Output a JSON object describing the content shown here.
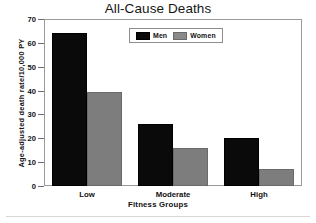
{
  "chart_data": {
    "type": "bar",
    "title": "All-Cause Deaths",
    "xlabel": "Fitness Groups",
    "ylabel": "Age-adjusted death rate/10,000 PY",
    "categories": [
      "Low",
      "Moderate",
      "High"
    ],
    "series": [
      {
        "name": "Men",
        "color": "#0a0a0a",
        "values": [
          64,
          26,
          20
        ]
      },
      {
        "name": "Women",
        "color": "#7d7d7d",
        "values": [
          39.5,
          16,
          7
        ]
      }
    ],
    "ylim": [
      0,
      70
    ],
    "yticks": [
      0,
      10,
      20,
      30,
      40,
      50,
      60,
      70
    ],
    "ytick_labels": [
      "0",
      "10",
      "20",
      "30",
      "40",
      "50",
      "60",
      "70"
    ],
    "grid": false,
    "legend_position": "top-center",
    "legend_entries": [
      "Men",
      "Women"
    ]
  },
  "colors": {
    "men": "#0a0a0a",
    "women": "#7d7d7d",
    "frame": "#9a9a9a",
    "text": "#111111",
    "background": "#ffffff"
  }
}
